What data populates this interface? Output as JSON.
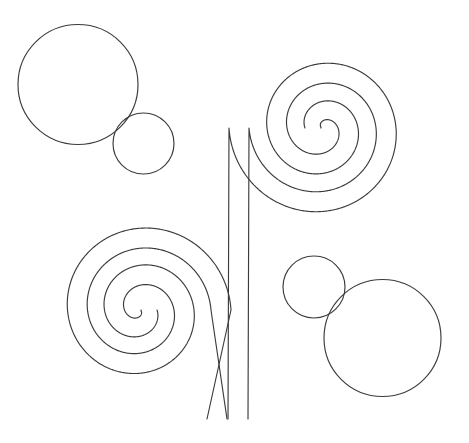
{
  "canvas": {
    "width": 469,
    "height": 443,
    "background_color": "#ffffff",
    "stroke_color": "#3b3b3b",
    "stroke_width": 1.15,
    "description": "Line drawing of two double-stroke ribbon spirals joined by vertical stems plus four plain circles"
  },
  "shapes": {
    "circle_top_left_large": {
      "name": "circle-top-left-large",
      "cx": 78,
      "cy": 84.5,
      "r": 60
    },
    "circle_top_left_small": {
      "name": "circle-top-left-small",
      "cx": 143.5,
      "cy": 143.5,
      "r": 30.5
    },
    "circle_bottom_right_small": {
      "name": "circle-bottom-right-small",
      "cx": 314,
      "cy": 287,
      "r": 31
    },
    "circle_bottom_right_large": {
      "name": "circle-bottom-right-large",
      "cx": 382.5,
      "cy": 338,
      "r": 58.5
    }
  },
  "spirals": {
    "spiral_top_right": {
      "name": "spiral-top-right",
      "cx": 322,
      "cy": 128,
      "outer_radius": 83,
      "inner_radius": 7,
      "turns": 2.0,
      "ribbon_width": 20,
      "direction": "counterclockwise",
      "start_angle_deg": 180,
      "stem_x_outer": 228,
      "stem_x_inner": 248,
      "stem_bottom_y": 419
    },
    "spiral_bottom_left": {
      "name": "spiral-bottom-left",
      "cx": 140,
      "cy": 310,
      "outer_radius": 81,
      "inner_radius": 7,
      "turns": 2.0,
      "ribbon_width": 20,
      "direction": "counterclockwise",
      "start_angle_deg": 0,
      "stem_x_outer": 207,
      "stem_x_inner": 227,
      "stem_bottom_y": 419
    }
  }
}
